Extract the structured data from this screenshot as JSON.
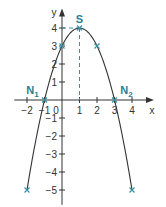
{
  "chart_data": {
    "type": "line",
    "title": "",
    "function": "f(x) = -x^2 + 2x + 3",
    "xlabel": "x",
    "ylabel": "y",
    "xlim": [
      -2.5,
      4.8
    ],
    "ylim": [
      -5.6,
      4.8
    ],
    "x_ticks": [
      -2,
      -1,
      0,
      1,
      2,
      3,
      4
    ],
    "x_tick_labels": [
      "−2",
      "−1",
      "0",
      "1",
      "2",
      "3",
      "4"
    ],
    "y_ticks": [
      -5,
      -4,
      -3,
      -2,
      -1,
      1,
      2,
      3,
      4
    ],
    "y_tick_labels": [
      "−5",
      "−4",
      "−3",
      "−2",
      "−1",
      "1",
      "2",
      "3",
      "4"
    ],
    "grid": false,
    "series": [
      {
        "name": "parabola",
        "x_range": [
          -2,
          4
        ],
        "color": "#333333"
      }
    ],
    "marked_points": [
      {
        "x": -2,
        "y": -5,
        "label": ""
      },
      {
        "x": -1,
        "y": 0,
        "label": "N",
        "sub": "1"
      },
      {
        "x": 0,
        "y": 3,
        "label": ""
      },
      {
        "x": 1,
        "y": 4,
        "label": "S",
        "sub": ""
      },
      {
        "x": 2,
        "y": 3,
        "label": ""
      },
      {
        "x": 3,
        "y": 0,
        "label": "N",
        "sub": "2"
      },
      {
        "x": 4,
        "y": -5,
        "label": ""
      }
    ],
    "guide_lines": [
      {
        "from": [
          0,
          4
        ],
        "to": [
          1,
          4
        ],
        "style": "dashed"
      },
      {
        "from": [
          1,
          4
        ],
        "to": [
          1,
          0
        ],
        "style": "dashed"
      }
    ],
    "colors": {
      "curve": "#333333",
      "axes": "#333333",
      "marker": "#3a8fa3",
      "guide": "#3a8fa3",
      "label": "#2a7f92"
    }
  }
}
